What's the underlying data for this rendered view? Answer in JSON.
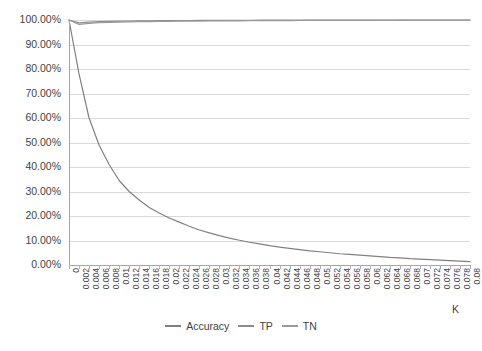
{
  "chart_data": {
    "type": "line",
    "title": "",
    "xlabel": "K",
    "ylabel": "",
    "ylim": [
      0,
      1
    ],
    "xlim": [
      0,
      0.08
    ],
    "grid": true,
    "legend_position": "bottom",
    "ytick_labels": [
      "100.00%",
      "90.00%",
      "80.00%",
      "70.00%",
      "60.00%",
      "50.00%",
      "40.00%",
      "30.00%",
      "20.00%",
      "10.00%",
      "0.00%"
    ],
    "ytick_values": [
      1.0,
      0.9,
      0.8,
      0.7,
      0.6,
      0.5,
      0.4,
      0.3,
      0.2,
      0.1,
      0.0
    ],
    "xtick_labels": [
      "0",
      "0.002",
      "0.004",
      "0.006",
      "0.008",
      "0.01",
      "0.012",
      "0.014",
      "0.016",
      "0.018",
      "0.02",
      "0.022",
      "0.024",
      "0.026",
      "0.028",
      "0.03",
      "0.032",
      "0.034",
      "0.036",
      "0.038",
      "0.04",
      "0.042",
      "0.044",
      "0.046",
      "0.048",
      "0.05",
      "0.052",
      "0.054",
      "0.056",
      "0.058",
      "0.06",
      "0.062",
      "0.064",
      "0.066",
      "0.068",
      "0.07",
      "0.072",
      "0.074",
      "0.076",
      "0.078",
      "0.08"
    ],
    "xtick_values": [
      0,
      0.002,
      0.004,
      0.006,
      0.008,
      0.01,
      0.012,
      0.014,
      0.016,
      0.018,
      0.02,
      0.022,
      0.024,
      0.026,
      0.028,
      0.03,
      0.032,
      0.034,
      0.036,
      0.038,
      0.04,
      0.042,
      0.044,
      0.046,
      0.048,
      0.05,
      0.052,
      0.054,
      0.056,
      0.058,
      0.06,
      0.062,
      0.064,
      0.066,
      0.068,
      0.07,
      0.072,
      0.074,
      0.076,
      0.078,
      0.08
    ],
    "series": [
      {
        "name": "Accuracy",
        "color": "#808080",
        "x": [
          0,
          0.002,
          0.004,
          0.006,
          0.008,
          0.01,
          0.012,
          0.014,
          0.016,
          0.018,
          0.02,
          0.022,
          0.024,
          0.026,
          0.028,
          0.03,
          0.032,
          0.034,
          0.036,
          0.038,
          0.04,
          0.042,
          0.044,
          0.046,
          0.048,
          0.05,
          0.052,
          0.054,
          0.056,
          0.058,
          0.06,
          0.062,
          0.064,
          0.066,
          0.068,
          0.07,
          0.072,
          0.074,
          0.076,
          0.078,
          0.08
        ],
        "values": [
          1.0,
          0.78,
          0.6,
          0.49,
          0.41,
          0.345,
          0.3,
          0.265,
          0.235,
          0.212,
          0.192,
          0.175,
          0.158,
          0.143,
          0.131,
          0.12,
          0.11,
          0.101,
          0.093,
          0.086,
          0.079,
          0.073,
          0.068,
          0.063,
          0.058,
          0.054,
          0.05,
          0.046,
          0.043,
          0.04,
          0.037,
          0.034,
          0.031,
          0.029,
          0.026,
          0.024,
          0.022,
          0.02,
          0.018,
          0.016,
          0.014
        ]
      },
      {
        "name": "TP",
        "color": "#8c8c8c",
        "x": [
          0,
          0.002,
          0.004,
          0.006,
          0.008,
          0.01,
          0.012,
          0.014,
          0.016,
          0.018,
          0.02,
          0.022,
          0.024,
          0.026,
          0.028,
          0.03,
          0.032,
          0.034,
          0.036,
          0.038,
          0.04,
          0.042,
          0.044,
          0.046,
          0.048,
          0.05,
          0.052,
          0.054,
          0.056,
          0.058,
          0.06,
          0.062,
          0.064,
          0.066,
          0.068,
          0.07,
          0.072,
          0.074,
          0.076,
          0.078,
          0.08
        ],
        "values": [
          1.0,
          0.988,
          0.991,
          0.993,
          0.994,
          0.995,
          0.996,
          0.9965,
          0.997,
          0.9972,
          0.9975,
          0.9978,
          0.998,
          0.9982,
          0.9984,
          0.9986,
          0.9987,
          0.9988,
          0.999,
          0.9991,
          0.9992,
          0.9993,
          0.9993,
          0.9994,
          0.9995,
          0.9995,
          0.9996,
          0.9996,
          0.9997,
          0.9997,
          0.9997,
          0.9998,
          0.9998,
          0.9998,
          0.9999,
          0.9999,
          0.9999,
          0.9999,
          1.0,
          1.0,
          1.0
        ]
      },
      {
        "name": "TN",
        "color": "#9a9a9a",
        "x": [
          0,
          0.002,
          0.004,
          0.006,
          0.008,
          0.01,
          0.012,
          0.014,
          0.016,
          0.018,
          0.02,
          0.022,
          0.024,
          0.026,
          0.028,
          0.03,
          0.032,
          0.034,
          0.036,
          0.038,
          0.04,
          0.042,
          0.044,
          0.046,
          0.048,
          0.05,
          0.052,
          0.054,
          0.056,
          0.058,
          0.06,
          0.062,
          0.064,
          0.066,
          0.068,
          0.07,
          0.072,
          0.074,
          0.076,
          0.078,
          0.08
        ],
        "values": [
          1.0,
          0.982,
          0.986,
          0.989,
          0.99,
          0.991,
          0.992,
          0.993,
          0.9935,
          0.994,
          0.9945,
          0.995,
          0.9953,
          0.9956,
          0.996,
          0.9962,
          0.9965,
          0.9967,
          0.997,
          0.9972,
          0.9974,
          0.9976,
          0.9978,
          0.998,
          0.9981,
          0.9982,
          0.9984,
          0.9985,
          0.9986,
          0.9987,
          0.9988,
          0.9989,
          0.999,
          0.9991,
          0.9992,
          0.9993,
          0.9994,
          0.9995,
          0.9996,
          0.9997,
          0.9998
        ]
      }
    ]
  },
  "legend": {
    "items": [
      {
        "label": "Accuracy"
      },
      {
        "label": "TP"
      },
      {
        "label": "TN"
      }
    ]
  },
  "axis": {
    "x_title": "K"
  }
}
